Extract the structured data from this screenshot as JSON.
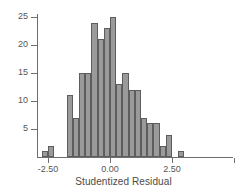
{
  "chart_data": {
    "type": "bar",
    "title": "",
    "subtitle": "",
    "xlabel": "Studentized Residual",
    "ylabel": "",
    "bin_width": 0.25,
    "bin_starts": [
      -2.75,
      -2.5,
      -1.75,
      -1.5,
      -1.25,
      -1.0,
      -0.75,
      -0.5,
      -0.25,
      0.0,
      0.25,
      0.5,
      0.75,
      1.0,
      1.25,
      1.5,
      1.75,
      2.0,
      2.25,
      2.5,
      2.75
    ],
    "categories": [
      "-2.75",
      "-2.50",
      "-1.75",
      "-1.50",
      "-1.25",
      "-1.00",
      "-0.75",
      "-0.50",
      "-0.25",
      "0.00",
      "0.25",
      "0.50",
      "0.75",
      "1.00",
      "1.25",
      "1.50",
      "1.75",
      "2.00",
      "2.25",
      "2.50",
      "2.75"
    ],
    "values": [
      1,
      2,
      11,
      7,
      15,
      15,
      24,
      21,
      23,
      25,
      13,
      15,
      12,
      12,
      7,
      6,
      6,
      2,
      4,
      0,
      1
    ],
    "xlim": [
      -3.2,
      4.7
    ],
    "ylim": [
      0,
      26
    ],
    "grid": false,
    "legend": false,
    "bar_color": "#9a9a9a",
    "bar_edge_color": "#5d5d5d",
    "axis_color": "#6e6e6e",
    "text_color": "#555555",
    "background": "#ffffff",
    "x_ticks": [
      {
        "value": -2.5,
        "label": "-2.50"
      },
      {
        "value": 0.0,
        "label": "0.00"
      },
      {
        "value": 2.5,
        "label": "2.50"
      },
      {
        "value": 5.0,
        "label": ""
      }
    ],
    "y_ticks": [
      {
        "value": 5,
        "label": "5"
      },
      {
        "value": 10,
        "label": "10"
      },
      {
        "value": 15,
        "label": "15"
      },
      {
        "value": 20,
        "label": "20"
      },
      {
        "value": 25,
        "label": "25"
      }
    ]
  }
}
